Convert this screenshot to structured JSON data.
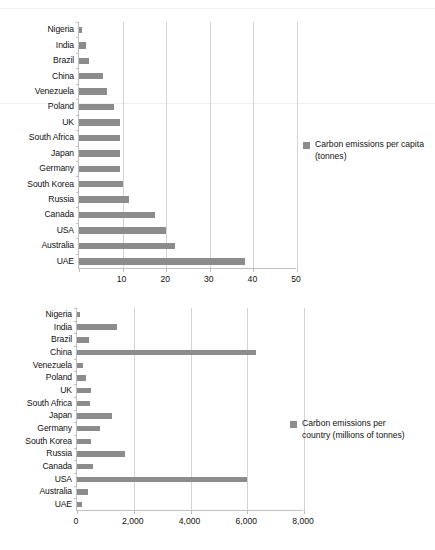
{
  "page": {
    "background": "#ffffff",
    "bar_color": "#8c8c8c",
    "grid_color": "#d4d4d4",
    "axis_color": "#bfbfbf"
  },
  "chart_data": [
    {
      "type": "bar",
      "orientation": "horizontal",
      "title": "",
      "xlabel": "",
      "ylabel": "",
      "legend": "Carbon emissions per capita (tonnes)",
      "legend_position": "right",
      "grid": true,
      "xlim": [
        0,
        50
      ],
      "xticks": [
        0,
        10,
        20,
        30,
        40,
        50
      ],
      "xtick_labels": [
        "",
        "10",
        "20",
        "30",
        "40",
        "50"
      ],
      "categories": [
        "Nigeria",
        "India",
        "Brazil",
        "China",
        "Venezuela",
        "Poland",
        "UK",
        "South Africa",
        "Japan",
        "Germany",
        "South Korea",
        "Russia",
        "Canada",
        "USA",
        "Australia",
        "UAE"
      ],
      "values": [
        0.7,
        1.5,
        2.3,
        5.5,
        6.5,
        8.0,
        9.3,
        9.3,
        9.4,
        9.4,
        10.2,
        11.5,
        17.5,
        20.0,
        22.0,
        38.0
      ]
    },
    {
      "type": "bar",
      "orientation": "horizontal",
      "title": "",
      "xlabel": "",
      "ylabel": "",
      "legend": "Carbon emissions per country (millions of tonnes)",
      "legend_position": "right",
      "grid": true,
      "xlim": [
        0,
        8000
      ],
      "xticks": [
        0,
        2000,
        4000,
        6000,
        8000
      ],
      "xtick_labels": [
        "0",
        "2,000",
        "4,000",
        "6,000",
        "8,000"
      ],
      "categories": [
        "Nigeria",
        "India",
        "Brazil",
        "China",
        "Venezuela",
        "Poland",
        "UK",
        "South Africa",
        "Japan",
        "Germany",
        "South Korea",
        "Russia",
        "Canada",
        "USA",
        "Australia",
        "UAE"
      ],
      "values": [
        100,
        1400,
        420,
        6300,
        200,
        300,
        480,
        450,
        1250,
        800,
        500,
        1700,
        550,
        6000,
        400,
        170
      ]
    }
  ]
}
